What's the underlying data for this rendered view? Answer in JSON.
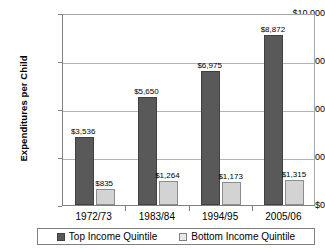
{
  "chart_data": {
    "type": "bar",
    "title": "",
    "xlabel": "",
    "ylabel": "Expenditures per Child",
    "ylim": [
      0,
      10000
    ],
    "ytick_values": [
      0,
      2500,
      5000,
      7500,
      10000
    ],
    "ytick_labels": [
      "$0",
      "$2,500",
      "$5,000",
      "$7,500",
      "$10,000"
    ],
    "grid": true,
    "legend_position": "bottom",
    "categories": [
      "1972/73",
      "1983/84",
      "1994/95",
      "2005/06"
    ],
    "series": [
      {
        "name": "Top Income Quintile",
        "color": "#595959",
        "values": [
          3536,
          5650,
          6975,
          8872
        ],
        "labels": [
          "$3,536",
          "$5,650",
          "$6,975",
          "$8,872"
        ]
      },
      {
        "name": "Bottom Income Quintile",
        "color": "#d3d3d3",
        "values": [
          835,
          1264,
          1173,
          1315
        ],
        "labels": [
          "$835",
          "$1,264",
          "$1,173",
          "$1,315"
        ]
      }
    ]
  }
}
